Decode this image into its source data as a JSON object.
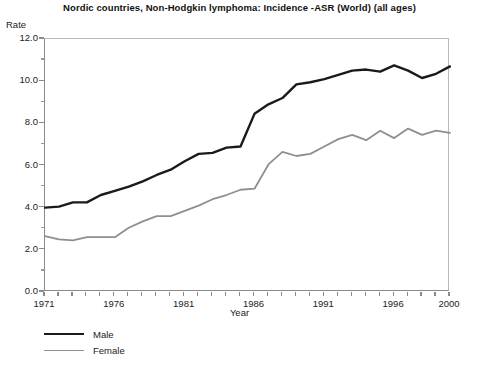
{
  "chart_data": {
    "type": "line",
    "title": "Nordic countries, Non-Hodgkin lymphoma:  Incidence -ASR (World) (all ages)",
    "xlabel": "Year",
    "ylabel": "Rate",
    "xlim": [
      1971,
      2000
    ],
    "ylim": [
      0.0,
      12.0
    ],
    "ytick_labels": [
      "12.0",
      "10.0",
      "8.0",
      "6.0",
      "4.0",
      "2.0",
      "0.0"
    ],
    "ytick_values": [
      12.0,
      10.0,
      8.0,
      6.0,
      4.0,
      2.0,
      0.0
    ],
    "yminor_values": [
      11.0,
      9.0,
      7.0,
      5.0,
      3.0,
      1.0
    ],
    "xtick_labels": [
      "1971",
      "1976",
      "1981",
      "1986",
      "1991",
      "1996",
      "2000"
    ],
    "xtick_values": [
      1971,
      1976,
      1981,
      1986,
      1991,
      1996,
      2000
    ],
    "xminor_step": 1,
    "grid": false,
    "legend_position": "below-left",
    "x": [
      1971,
      1972,
      1973,
      1974,
      1975,
      1976,
      1977,
      1978,
      1979,
      1980,
      1981,
      1982,
      1983,
      1984,
      1985,
      1986,
      1987,
      1988,
      1989,
      1990,
      1991,
      1992,
      1993,
      1994,
      1995,
      1996,
      1997,
      1998,
      1999,
      2000
    ],
    "series": [
      {
        "name": "Male",
        "color": "#1a1a1a",
        "width": 2.4,
        "values": [
          4.0,
          4.05,
          4.25,
          4.25,
          4.6,
          4.8,
          5.0,
          5.25,
          5.55,
          5.8,
          6.2,
          6.55,
          6.6,
          6.85,
          6.9,
          8.45,
          8.9,
          9.2,
          9.85,
          9.95,
          10.1,
          10.3,
          10.5,
          10.55,
          10.45,
          10.75,
          10.5,
          10.15,
          10.35,
          10.7
        ]
      },
      {
        "name": "Female",
        "color": "#8f8f8f",
        "width": 1.8,
        "values": [
          2.65,
          2.5,
          2.45,
          2.6,
          2.6,
          2.6,
          3.05,
          3.35,
          3.6,
          3.6,
          3.85,
          4.1,
          4.4,
          4.6,
          4.85,
          4.9,
          6.05,
          6.65,
          6.45,
          6.55,
          6.9,
          7.25,
          7.45,
          7.2,
          7.65,
          7.3,
          7.75,
          7.45,
          7.65,
          7.55
        ]
      }
    ]
  },
  "legend": {
    "items": [
      {
        "label": "Male"
      },
      {
        "label": "Female"
      }
    ]
  },
  "footnote": {
    "text": ""
  }
}
